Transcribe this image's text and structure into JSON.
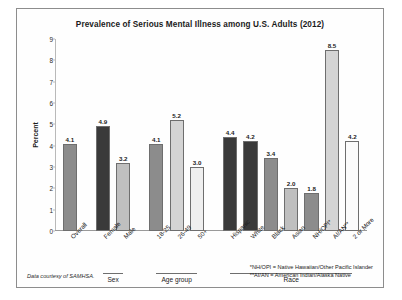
{
  "chart_data": {
    "type": "bar",
    "title": "Prevalence of Serious Mental Illness among U.S. Adults (2012)",
    "xlabel": "",
    "ylabel": "Percent",
    "ylim": [
      0,
      9
    ],
    "yticks": [
      0,
      1,
      2,
      3,
      4,
      5,
      6,
      7,
      8,
      9
    ],
    "grid": false,
    "legend": "none",
    "categories": [
      "Overall",
      "Female",
      "Male",
      "18-25",
      "26-49",
      "50+",
      "Hispanic",
      "White",
      "Black",
      "Asian",
      "NH/OPI*",
      "AI/AN**",
      "2 or More"
    ],
    "values": [
      4.1,
      4.9,
      3.2,
      4.1,
      5.2,
      3.0,
      4.4,
      4.2,
      3.4,
      2.0,
      1.8,
      8.5,
      4.2
    ],
    "value_labels": [
      "4.1",
      "4.9",
      "3.2",
      "4.1",
      "5.2",
      "3.0",
      "4.4",
      "4.2",
      "3.4",
      "2.0",
      "1.8",
      "8.5",
      "4.2"
    ],
    "bar_colors": [
      "#8c8c8c",
      "#3a3a3a",
      "#bfbfbf",
      "#8c8c8c",
      "#d4d4d4",
      "#efefef",
      "#3a3a3a",
      "#3a3a3a",
      "#8c8c8c",
      "#bfbfbf",
      "#8c8c8c",
      "#d4d4d4",
      "#fbfbfb"
    ],
    "groups": [
      {
        "label": "Sex",
        "start": 1,
        "end": 2
      },
      {
        "label": "Age group",
        "start": 3,
        "end": 5
      },
      {
        "label": "Race",
        "start": 6,
        "end": 12
      }
    ]
  },
  "notes": {
    "source": "Data courtesy of SAMHSA.",
    "footnote_1": "*NH/OPI = Native Hawaiian/Other Pacific Islander",
    "footnote_2": "**AI/AN = American Indian/Alaska Native"
  }
}
